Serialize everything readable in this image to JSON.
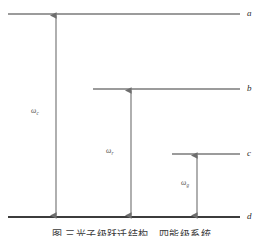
{
  "figure": {
    "type": "energy-level-diagram",
    "background_color": "#ffffff",
    "line_color": "#7a7a7a",
    "ground_line_color": "#3c3c3c",
    "arrow_color": "#6e6e6e",
    "label_color": "#2b2b2b",
    "width": 263,
    "height": 236,
    "levels": [
      {
        "id": "a",
        "label": "a",
        "y": 14,
        "x_start": 8,
        "x_end": 240,
        "thickness": 1.6,
        "label_x": 247,
        "label_y": 9
      },
      {
        "id": "b",
        "label": "b",
        "y": 89,
        "x_start": 93,
        "x_end": 240,
        "thickness": 1.6,
        "label_x": 247,
        "label_y": 84
      },
      {
        "id": "c",
        "label": "c",
        "y": 154,
        "x_start": 172,
        "x_end": 240,
        "thickness": 1.6,
        "label_x": 247,
        "label_y": 149
      },
      {
        "id": "d",
        "label": "d",
        "y": 217,
        "x_start": 8,
        "x_end": 240,
        "thickness": 2.2,
        "label_x": 247,
        "label_y": 212
      }
    ],
    "transitions": [
      {
        "id": "t1",
        "from_level": "d",
        "to_level": "a",
        "x": 56,
        "y_top": 14,
        "y_bottom": 217,
        "symbol": "ω",
        "subscript": "c",
        "label_x": 31,
        "label_y": 107
      },
      {
        "id": "t2",
        "from_level": "d",
        "to_level": "b",
        "x": 131,
        "y_top": 89,
        "y_bottom": 217,
        "symbol": "ω",
        "subscript": "r",
        "label_x": 106,
        "label_y": 147
      },
      {
        "id": "t3",
        "from_level": "d",
        "to_level": "c",
        "x": 197,
        "y_top": 154,
        "y_bottom": 217,
        "symbol": "ω",
        "subscript": "g",
        "label_x": 181,
        "label_y": 179
      }
    ]
  },
  "caption": {
    "text": "图      三光子级跃迁结构　四能级系统"
  }
}
